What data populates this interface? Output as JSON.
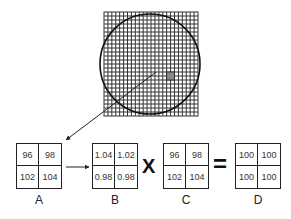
{
  "figure": {
    "grid": {
      "x": 104,
      "y": 12,
      "width": 94,
      "height": 104,
      "columns": 24,
      "rows": 26,
      "highlight": {
        "col": 16,
        "row": 15,
        "color": "#888888"
      }
    },
    "circle": {
      "cx": 150,
      "cy": 64,
      "r": 50
    },
    "pointer_arrow": {
      "from": [
        156,
        72
      ],
      "to": [
        66,
        140
      ]
    },
    "matrices": [
      {
        "id": "A",
        "label": "A",
        "x": 16,
        "values": [
          "96",
          "98",
          "102",
          "104"
        ]
      },
      {
        "id": "B",
        "label": "B",
        "x": 92,
        "values": [
          "1.04",
          "1.02",
          "0.98",
          "0.98"
        ]
      },
      {
        "id": "C",
        "label": "C",
        "x": 163,
        "values": [
          "96",
          "98",
          "102",
          "104"
        ]
      },
      {
        "id": "D",
        "label": "D",
        "x": 235,
        "values": [
          "100",
          "100",
          "100",
          "100"
        ]
      }
    ],
    "operators": {
      "multiply": "X",
      "equals": "="
    },
    "flow_arrow": {
      "from": [
        66,
        167
      ],
      "to": [
        89,
        167
      ]
    }
  }
}
